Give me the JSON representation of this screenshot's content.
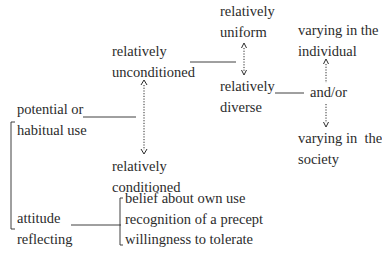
{
  "diagram": {
    "nodes": {
      "unconditioned": {
        "line1": "relatively",
        "line2": "unconditioned"
      },
      "conditioned": {
        "line1": "relatively",
        "line2": "conditioned"
      },
      "uniform": {
        "line1": "relatively",
        "line2": "uniform"
      },
      "diverse": {
        "line1": "relatively",
        "line2": "diverse"
      },
      "and_or": {
        "label": "and/or"
      },
      "individual": {
        "line1": "varying in the",
        "line2": "individual"
      },
      "society": {
        "line1": "varying in  the",
        "line2": "society"
      },
      "use": {
        "line1": "potential or",
        "line2": "habitual use"
      },
      "attitude": {
        "line1": "attitude",
        "line2": "reflecting"
      }
    },
    "attitude_items": [
      "belief about own use",
      "recognition of a precept",
      "willingness to tolerate"
    ],
    "colors": {
      "ink": "#2b2b2b",
      "background": "#ffffff"
    }
  }
}
